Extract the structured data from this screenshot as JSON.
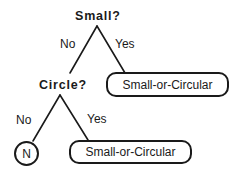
{
  "tree": {
    "root": {
      "question": "Small?",
      "no_label": "No",
      "yes_label": "Yes",
      "yes_leaf": "Small-or-Circular"
    },
    "child": {
      "question": "Circle?",
      "no_label": "No",
      "yes_label": "Yes",
      "no_leaf": "N",
      "yes_leaf": "Small-or-Circular"
    }
  },
  "colors": {
    "stroke": "#1a1a1a",
    "background": "#ffffff"
  }
}
